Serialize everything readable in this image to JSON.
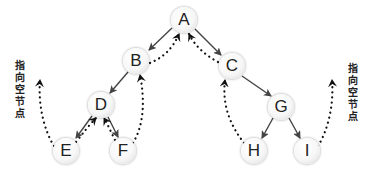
{
  "diagram": {
    "type": "threaded-binary-tree",
    "colors": {
      "edge": "#444444",
      "thread": "#111111",
      "node_fill": "#f7f7f7",
      "text": "#222222"
    },
    "nodes": [
      {
        "id": "A",
        "label": "A",
        "x": 184,
        "y": 20
      },
      {
        "id": "B",
        "label": "B",
        "x": 136,
        "y": 61
      },
      {
        "id": "C",
        "label": "C",
        "x": 232,
        "y": 66
      },
      {
        "id": "D",
        "label": "D",
        "x": 101,
        "y": 105
      },
      {
        "id": "E",
        "label": "E",
        "x": 66,
        "y": 151
      },
      {
        "id": "F",
        "label": "F",
        "x": 123,
        "y": 151
      },
      {
        "id": "G",
        "label": "G",
        "x": 281,
        "y": 107
      },
      {
        "id": "H",
        "label": "H",
        "x": 254,
        "y": 151
      },
      {
        "id": "I",
        "label": "I",
        "x": 307,
        "y": 151
      }
    ],
    "edges": [
      {
        "from": "A",
        "to": "B"
      },
      {
        "from": "A",
        "to": "C"
      },
      {
        "from": "B",
        "to": "D"
      },
      {
        "from": "D",
        "to": "E"
      },
      {
        "from": "D",
        "to": "F"
      },
      {
        "from": "C",
        "to": "G"
      },
      {
        "from": "G",
        "to": "H"
      },
      {
        "from": "G",
        "to": "I"
      }
    ],
    "threads": [
      {
        "from": "E",
        "to": "null-left"
      },
      {
        "from": "E",
        "to": "D"
      },
      {
        "from": "F",
        "to": "D"
      },
      {
        "from": "F",
        "to": "B"
      },
      {
        "from": "B",
        "to": "A"
      },
      {
        "from": "C",
        "to": "A"
      },
      {
        "from": "H",
        "to": "C"
      },
      {
        "from": "I",
        "to": "null-right"
      }
    ],
    "labels": {
      "left_null": [
        "指",
        "向",
        "空",
        "节",
        "点"
      ],
      "right_null": [
        "指",
        "向",
        "空",
        "节",
        "点"
      ]
    }
  }
}
